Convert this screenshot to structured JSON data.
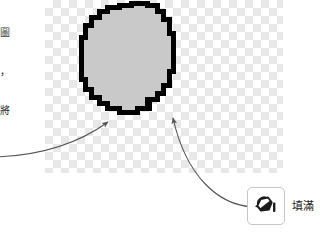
{
  "document_text": {
    "line1": "的圖",
    "line2": "籤，",
    "line3": "，將"
  },
  "canvas": {
    "name": "transparent-canvas",
    "background": "checkerboard",
    "checker_light": "#ffffff",
    "checker_dark": "#e8e8e8",
    "checker_size_px": 8
  },
  "shape": {
    "name": "filled-circle",
    "outline_color": "#000000",
    "fill_color": "#c9c9c9",
    "outline_width_px": 5
  },
  "annotations": {
    "arrow_left": {
      "name": "arrow-to-shape-edge",
      "color": "#555555"
    },
    "arrow_right": {
      "name": "arrow-tool-to-shape",
      "color": "#555555"
    }
  },
  "tool_callout": {
    "icon": "paint-bucket-icon",
    "label": "填滿",
    "button_border": "#c6c6c6",
    "button_background": "#ffffff"
  }
}
